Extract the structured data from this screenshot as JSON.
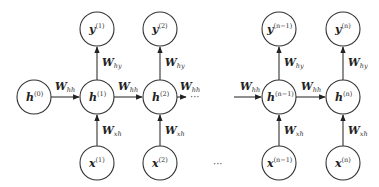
{
  "diagram": {
    "initial_state": {
      "base": "h",
      "sup": "(0)"
    },
    "columns": [
      {
        "y": {
          "base": "y",
          "sup": "(1)"
        },
        "h": {
          "base": "h",
          "sup": "(1)"
        },
        "x": {
          "base": "x",
          "sup": "(1)"
        }
      },
      {
        "y": {
          "base": "y",
          "sup": "(2)"
        },
        "h": {
          "base": "h",
          "sup": "(2)"
        },
        "x": {
          "base": "x",
          "sup": "(2)"
        }
      },
      {
        "y": {
          "base": "y",
          "sup": "(n−1)"
        },
        "h": {
          "base": "h",
          "sup": "(n−1)"
        },
        "x": {
          "base": "x",
          "sup": "(n−1)"
        }
      },
      {
        "y": {
          "base": "y",
          "sup": "(n)"
        },
        "h": {
          "base": "h",
          "sup": "(n)"
        },
        "x": {
          "base": "x",
          "sup": "(n)"
        }
      }
    ],
    "weights": {
      "hh": {
        "base": "W",
        "sub": "hh"
      },
      "hy": {
        "base": "W",
        "sub": "hy"
      },
      "xh": {
        "base": "W",
        "sub": "xh"
      }
    },
    "ellipsis": "···"
  }
}
